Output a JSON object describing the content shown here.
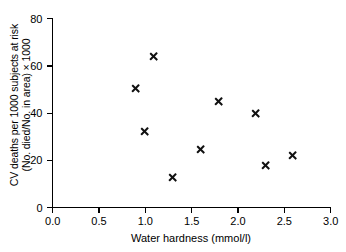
{
  "chart_data": {
    "type": "scatter",
    "title": "",
    "xlabel": "Water hardness (mmol/l)",
    "ylabel_lines": [
      "CV deaths per 1000 subjects at risk",
      "(No. died/No. in area) × 1000"
    ],
    "xlim": [
      0.0,
      3.0
    ],
    "ylim": [
      0,
      80
    ],
    "grid": false,
    "legend": "none",
    "marker": "x",
    "marker_color": "#111111",
    "xticks": [
      0.0,
      0.5,
      1.0,
      1.5,
      2.0,
      2.5,
      3.0
    ],
    "xtick_labels": [
      "0.0",
      "0.5",
      "1.0",
      "1.5",
      "2.0",
      "2.5",
      "3.0"
    ],
    "yticks": [
      0,
      20,
      40,
      60,
      80
    ],
    "ytick_labels": [
      "0",
      "20",
      "40",
      "60",
      "80"
    ],
    "series": [
      {
        "name": "areas",
        "points": [
          {
            "x": 0.9,
            "y": 50.0
          },
          {
            "x": 1.1,
            "y": 63.5
          },
          {
            "x": 1.0,
            "y": 32.0
          },
          {
            "x": 1.3,
            "y": 12.5
          },
          {
            "x": 1.6,
            "y": 24.5
          },
          {
            "x": 1.8,
            "y": 44.5
          },
          {
            "x": 2.2,
            "y": 39.5
          },
          {
            "x": 2.3,
            "y": 17.5
          },
          {
            "x": 2.6,
            "y": 22.0
          }
        ]
      }
    ]
  }
}
